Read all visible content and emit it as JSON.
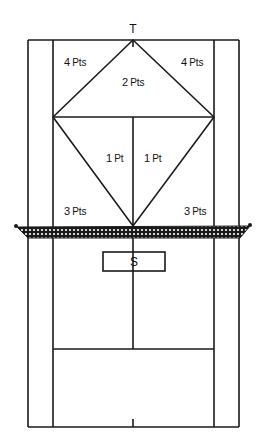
{
  "diagram": {
    "target_label": "T",
    "server_label": "S",
    "zones": [
      {
        "id": "top-left-corner",
        "num": "4",
        "unit": "Pts"
      },
      {
        "id": "top-right-corner",
        "num": "4",
        "unit": "Pts"
      },
      {
        "id": "top-diamond",
        "num": "2",
        "unit": "Pts"
      },
      {
        "id": "inner-left-triangle",
        "num": "1",
        "unit": "Pt"
      },
      {
        "id": "inner-right-triangle",
        "num": "1",
        "unit": "Pt"
      },
      {
        "id": "lower-left",
        "num": "3",
        "unit": "Pts"
      },
      {
        "id": "lower-right",
        "num": "3",
        "unit": "Pts"
      }
    ],
    "colors": {
      "line": "#1a1a1a",
      "background": "#ffffff",
      "net": "#1a1a1a"
    }
  }
}
